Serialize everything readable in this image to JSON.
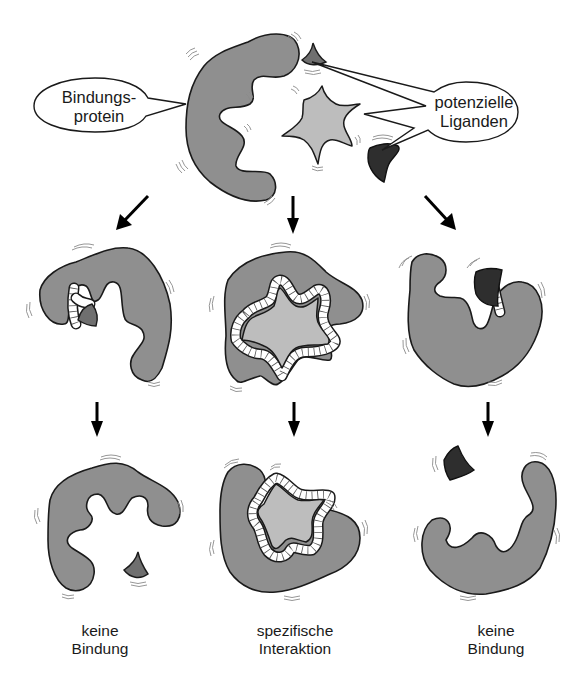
{
  "diagram": {
    "top": {
      "protein_callout": {
        "line1": "Bindungs-",
        "line2": "protein"
      },
      "ligands_callout": {
        "line1": "potenzielle",
        "line2": "Liganden"
      }
    },
    "columns": [
      {
        "ligand": "small-wedge-ligand",
        "outcome_line1": "keine",
        "outcome_line2": "Bindung"
      },
      {
        "ligand": "star-ligand",
        "outcome_line1": "spezifische",
        "outcome_line2": "Interaktion"
      },
      {
        "ligand": "dark-crescent-ligand",
        "outcome_line1": "keine",
        "outcome_line2": "Bindung"
      }
    ],
    "colors": {
      "protein": "#8f8f8f",
      "star_ligand": "#bdbdbd",
      "wedge_ligand": "#6f6f6f",
      "dark_ligand": "#2e2e2e",
      "outline": "#1a1a1a"
    }
  }
}
